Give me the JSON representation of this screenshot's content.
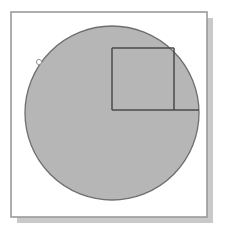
{
  "figure": {
    "canvas": {
      "width": 227,
      "height": 236,
      "background": "#ffffff"
    },
    "frame": {
      "label": "figure-border",
      "x": 11,
      "y": 12,
      "width": 196,
      "height": 205,
      "fill": "#ffffff",
      "stroke": "#9a9a9a",
      "stroke_width": 1.6,
      "shadow": {
        "label": "drop-shadow",
        "offset_x": 6,
        "offset_y": 6,
        "color": "#c9c9c9"
      }
    },
    "circle": {
      "label": "gray-circle",
      "center_x": 112,
      "center_y": 113,
      "radius": 87,
      "fill": "#b6b6b6",
      "stroke": "#6e6e6e",
      "stroke_width": 1.3
    },
    "square": {
      "label": "inscribed-square",
      "x": 112,
      "y": 48,
      "size": 62,
      "fill": "none",
      "stroke": "#4a4a4a",
      "stroke_width": 1.5,
      "note": "bottom-left vertex at circle center, top-right vertex on circumference"
    },
    "radius_line": {
      "label": "radius-line",
      "x1": 112,
      "y1": 110,
      "x2": 199,
      "y2": 110,
      "stroke": "#4a4a4a",
      "stroke_width": 1.5
    },
    "vertical_line": {
      "label": "vertical-segment",
      "x1": 112,
      "y1": 48,
      "x2": 112,
      "y2": 110,
      "stroke": "#4a4a4a",
      "stroke_width": 1.5
    },
    "marker": {
      "label": "circumference-point-marker",
      "x": 39,
      "y": 62,
      "dot_radius": 2.6,
      "dot_fill": "#ffffff",
      "dot_stroke": "#8a8a8a",
      "tick_stroke": "#ffffff",
      "tick_points": "33,50 38,59 36,62 42,57"
    }
  }
}
